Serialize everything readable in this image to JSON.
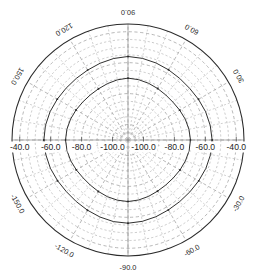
{
  "chart_data": {
    "type": "line",
    "plot_style": "polar",
    "title": "",
    "subtitle": "",
    "xlabel": "",
    "ylabel": "",
    "grid": true,
    "legend": null,
    "legend_position": "none",
    "angular_axis": {
      "unit": "degrees",
      "tick_step": 30,
      "tick_labels": [
        "90.0",
        "60.0",
        "30.0",
        "-30.0",
        "-60.0",
        "-90.0",
        "-120.0",
        "-150.0",
        "150.0",
        "120.0"
      ],
      "tick_angles_deg": [
        90,
        60,
        30,
        -30,
        -60,
        -90,
        -120,
        -150,
        150,
        120
      ],
      "minor_tick_step": 10
    },
    "radial_axis": {
      "unit": "dB",
      "tick_labels": [
        "-40.0",
        "-60.0",
        "-80.0",
        "-100.0"
      ],
      "tick_values": [
        -40,
        -60,
        -80,
        -100
      ],
      "rlim": [
        -110,
        -35
      ],
      "outer_value": -35,
      "center_value": -110,
      "direction": "inward-decreasing",
      "label_side": "both",
      "minor_ring_step": 5
    },
    "series": [
      {
        "name": "curve-outer",
        "marker": "dot",
        "linestyle": "solid",
        "color": "#30302f",
        "points": [
          {
            "angle": 90,
            "r": -56.0
          },
          {
            "angle": 80,
            "r": -56.4
          },
          {
            "angle": 70,
            "r": -57.0
          },
          {
            "angle": 60,
            "r": -57.6
          },
          {
            "angle": 50,
            "r": -58.0
          },
          {
            "angle": 40,
            "r": -58.0
          },
          {
            "angle": 30,
            "r": -57.4
          },
          {
            "angle": 20,
            "r": -56.6
          },
          {
            "angle": 10,
            "r": -56.0
          },
          {
            "angle": 0,
            "r": -55.6
          },
          {
            "angle": -10,
            "r": -55.8
          },
          {
            "angle": -20,
            "r": -56.4
          },
          {
            "angle": -30,
            "r": -57.2
          },
          {
            "angle": -40,
            "r": -57.8
          },
          {
            "angle": -50,
            "r": -58.0
          },
          {
            "angle": -60,
            "r": -57.8
          },
          {
            "angle": -70,
            "r": -57.2
          },
          {
            "angle": -80,
            "r": -56.6
          },
          {
            "angle": -90,
            "r": -56.2
          },
          {
            "angle": -100,
            "r": -56.4
          },
          {
            "angle": -110,
            "r": -57.0
          },
          {
            "angle": -120,
            "r": -57.6
          },
          {
            "angle": -130,
            "r": -58.0
          },
          {
            "angle": -140,
            "r": -58.0
          },
          {
            "angle": -150,
            "r": -57.4
          },
          {
            "angle": -160,
            "r": -56.6
          },
          {
            "angle": -170,
            "r": -56.0
          },
          {
            "angle": 180,
            "r": -55.6
          },
          {
            "angle": 170,
            "r": -55.8
          },
          {
            "angle": 160,
            "r": -56.4
          },
          {
            "angle": 150,
            "r": -57.2
          },
          {
            "angle": 140,
            "r": -57.8
          },
          {
            "angle": 130,
            "r": -58.0
          },
          {
            "angle": 120,
            "r": -57.8
          },
          {
            "angle": 110,
            "r": -57.2
          },
          {
            "angle": 100,
            "r": -56.5
          }
        ]
      },
      {
        "name": "curve-inner",
        "marker": "dot",
        "linestyle": "solid",
        "color": "#30302f",
        "points": [
          {
            "angle": 90,
            "r": -70.0
          },
          {
            "angle": 80,
            "r": -70.4
          },
          {
            "angle": 70,
            "r": -71.0
          },
          {
            "angle": 60,
            "r": -71.6
          },
          {
            "angle": 50,
            "r": -72.0
          },
          {
            "angle": 40,
            "r": -72.0
          },
          {
            "angle": 30,
            "r": -71.4
          },
          {
            "angle": 20,
            "r": -70.6
          },
          {
            "angle": 10,
            "r": -70.0
          },
          {
            "angle": 0,
            "r": -69.6
          },
          {
            "angle": -10,
            "r": -69.9
          },
          {
            "angle": -20,
            "r": -70.5
          },
          {
            "angle": -30,
            "r": -71.2
          },
          {
            "angle": -40,
            "r": -71.8
          },
          {
            "angle": -50,
            "r": -72.0
          },
          {
            "angle": -60,
            "r": -71.8
          },
          {
            "angle": -70,
            "r": -71.2
          },
          {
            "angle": -80,
            "r": -70.6
          },
          {
            "angle": -90,
            "r": -70.2
          },
          {
            "angle": -100,
            "r": -70.5
          },
          {
            "angle": -110,
            "r": -71.0
          },
          {
            "angle": -120,
            "r": -71.6
          },
          {
            "angle": -130,
            "r": -72.0
          },
          {
            "angle": -140,
            "r": -72.0
          },
          {
            "angle": -150,
            "r": -71.4
          },
          {
            "angle": -160,
            "r": -70.6
          },
          {
            "angle": -170,
            "r": -70.0
          },
          {
            "angle": 180,
            "r": -69.6
          },
          {
            "angle": 170,
            "r": -69.9
          },
          {
            "angle": 160,
            "r": -70.5
          },
          {
            "angle": 150,
            "r": -71.2
          },
          {
            "angle": 140,
            "r": -71.8
          },
          {
            "angle": 130,
            "r": -72.0
          },
          {
            "angle": 120,
            "r": -71.8
          },
          {
            "angle": 110,
            "r": -71.2
          },
          {
            "angle": 100,
            "r": -70.5
          }
        ]
      }
    ]
  },
  "geometry": {
    "cx": 128,
    "cy": 140,
    "r_outer": 116
  },
  "labels": {
    "angular": [
      {
        "text": "90.0",
        "angle": 90
      },
      {
        "text": "60.0",
        "angle": 60
      },
      {
        "text": "30.0",
        "angle": 30
      },
      {
        "text": "-30.0",
        "angle": -30
      },
      {
        "text": "-60.0",
        "angle": -60
      },
      {
        "text": "-90.0",
        "angle": -90
      },
      {
        "text": "-120.0",
        "angle": -120
      },
      {
        "text": "-150.0",
        "angle": -150
      },
      {
        "text": "150.0",
        "angle": 150
      },
      {
        "text": "120.0",
        "angle": 120
      }
    ],
    "radial_left": [
      "-40.0",
      "-60.0",
      "-80.0",
      "-100.0"
    ],
    "radial_right": [
      "-100.0",
      "-80.0",
      "-60.0",
      "-40.0"
    ]
  },
  "colors": {
    "background": "#ffffff",
    "grid": "#9a9a9a",
    "curve": "#30302f",
    "outline": "#2b2b2b",
    "text": "#1d1d1d"
  }
}
